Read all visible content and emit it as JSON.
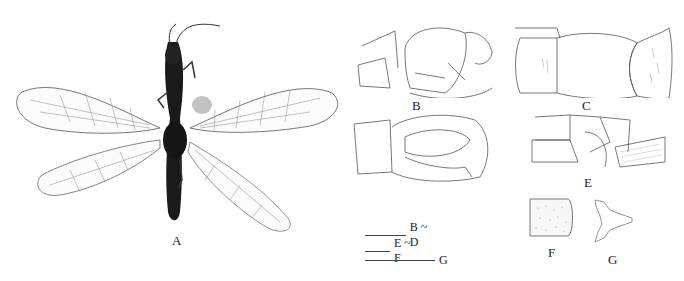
{
  "figure": {
    "panels": [
      {
        "id": "A",
        "label": "A",
        "content": "habitus, dorsal view (photograph)"
      },
      {
        "id": "B",
        "label": "B",
        "content": "genitalia, lateral view"
      },
      {
        "id": "C",
        "label": "C",
        "content": "genitalia, dorsal view"
      },
      {
        "id": "D",
        "label": "D",
        "content": "genitalia, ventral view"
      },
      {
        "id": "E",
        "label": "E",
        "content": "abdominal segments, lateral view"
      },
      {
        "id": "F",
        "label": "F",
        "content": "sclerite plate"
      },
      {
        "id": "G",
        "label": "G",
        "content": "structure, ventral view"
      }
    ],
    "scale_bars": [
      {
        "label": "B ~ D"
      },
      {
        "label": "E ~ F"
      },
      {
        "label": "G"
      }
    ]
  }
}
